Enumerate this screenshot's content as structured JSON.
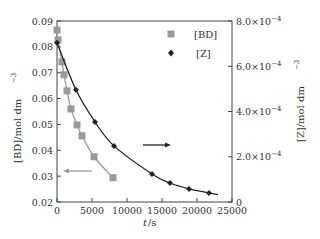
{
  "chart_data": {
    "type": "line",
    "title": "",
    "xlabel": "t/s",
    "ylabel": "[BD]/mol dm⁻³",
    "ylabel_right": "[Z]/mol dm⁻³",
    "xlim": [
      0,
      25000
    ],
    "ylim": [
      0.02,
      0.09
    ],
    "ylim_right": [
      0,
      0.0008
    ],
    "x_ticks": [
      "0",
      "5000",
      "10000",
      "15000",
      "20000",
      "25000"
    ],
    "y_ticks": [
      "0.02",
      "0.03",
      "0.04",
      "0.05",
      "0.06",
      "0.07",
      "0.08",
      "0.09"
    ],
    "y_ticks_right": [
      "0",
      "2.0×10⁻⁴",
      "4.0×10⁻⁴",
      "6.0×10⁻⁴",
      "8.0×10⁻⁴"
    ],
    "grid": false,
    "legend_position": "upper right",
    "series": [
      {
        "name": "[BD]",
        "axis": "left",
        "marker": "square",
        "color": "#9a9a9a",
        "x": [
          0,
          140,
          710,
          1000,
          1430,
          2000,
          2860,
          3570,
          5290,
          8000
        ],
        "values": [
          0.0865,
          0.0827,
          0.0742,
          0.0692,
          0.063,
          0.056,
          0.0498,
          0.0456,
          0.0375,
          0.0294
        ]
      },
      {
        "name": "[Z]",
        "axis": "right",
        "marker": "diamond",
        "color": "#222222",
        "x": [
          0,
          2710,
          5430,
          8140,
          13570,
          16140,
          18860,
          21710
        ],
        "values": [
          0.000704,
          0.000496,
          0.000354,
          0.000248,
          0.000124,
          8.4e-05,
          5.8e-05,
          4e-05
        ]
      }
    ],
    "annotations": [
      {
        "type": "arrow",
        "direction": "left",
        "color": "#9a9a9a",
        "meaning": "[BD] uses left axis"
      },
      {
        "type": "arrow",
        "direction": "right",
        "color": "#222222",
        "meaning": "[Z] uses right axis"
      }
    ]
  },
  "labels": {
    "xlabel_t": "t",
    "xlabel_unit": "/s",
    "ylabel_left": "[BD]/mol dm",
    "ylabel_left_sup": "−3",
    "ylabel_right": "[Z]/mol dm",
    "ylabel_right_sup": "−3",
    "legend_bd": "[BD]",
    "legend_z": "[Z]",
    "right_tick_mantissas": [
      "0",
      "2.0×10",
      "4.0×10",
      "6.0×10",
      "8.0×10"
    ],
    "right_tick_exp": "−4"
  }
}
